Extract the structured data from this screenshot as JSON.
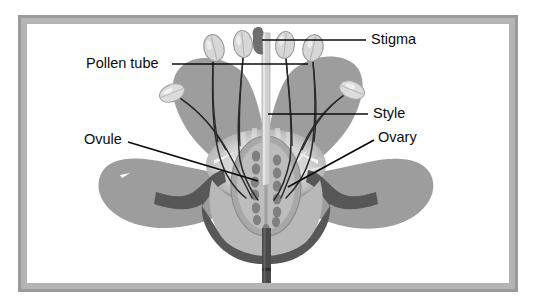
{
  "figure": {
    "title_text": "",
    "kind": "flower-cross-section-diagram",
    "background_color": "#ffffff",
    "frame": {
      "border_color": "#9a9a9a",
      "border_highlight_color": "#c9c9c9",
      "inner_fill": "#ffffff",
      "x": 18,
      "y": 15,
      "width": 500,
      "height": 277,
      "thickness": 9
    }
  },
  "labels": {
    "stigma": {
      "text": "Stigma",
      "x": 371,
      "y": 39
    },
    "pollen_tube": {
      "text": "Pollen tube",
      "x": 86,
      "y": 64
    },
    "style": {
      "text": "Style",
      "x": 373,
      "y": 113
    },
    "ovule": {
      "text": "Ovule",
      "x": 84,
      "y": 139
    },
    "ovary": {
      "text": "Ovary",
      "x": 378,
      "y": 137
    }
  },
  "colors": {
    "petal": "#9d9d9d",
    "petal_shadow": "#8a8a8a",
    "petal_highlight": "#d8d8d8",
    "sepal_dark": "#575757",
    "receptacle_mid": "#b8b8b8",
    "ovary_wall": "#a8a8a8",
    "ovary_inner": "#bdbdbd",
    "ovule_dot": "#808080",
    "anther_fill": "#d7d7d7",
    "anther_edge": "#9b9b9b",
    "style_shaft": "#cfcfcf",
    "stigma_knob": "#6e6e6e",
    "stem": "#4a4a4a",
    "line_black": "#0b0b0b"
  },
  "structures": {
    "anthers_upper": [
      {
        "name": "anther-upper-1",
        "cx": 214,
        "cy": 48,
        "rx": 10,
        "ry": 13,
        "rot": -14
      },
      {
        "name": "anther-upper-2",
        "cx": 243,
        "cy": 44,
        "rx": 9.5,
        "ry": 13,
        "rot": -6
      },
      {
        "name": "anther-upper-3",
        "cx": 284,
        "cy": 45,
        "rx": 9.5,
        "ry": 13,
        "rot": 6
      },
      {
        "name": "anther-upper-4",
        "cx": 312,
        "cy": 48,
        "rx": 10,
        "ry": 13,
        "rot": 13
      }
    ],
    "anthers_side": [
      {
        "name": "anther-side-left",
        "cx": 172,
        "cy": 93,
        "rx": 12,
        "ry": 8,
        "rot": -20
      },
      {
        "name": "anther-side-right",
        "cx": 352,
        "cy": 90,
        "rx": 12,
        "ry": 8,
        "rot": 20
      }
    ],
    "style": {
      "x": 266,
      "y_top": 34,
      "y_bottom": 185,
      "width": 7
    },
    "stigma": {
      "cx": 259,
      "cy": 38,
      "rx": 6,
      "ry": 9
    },
    "ovary": {
      "cx": 266,
      "cy": 186,
      "rx": 33,
      "ry": 48
    },
    "ovules": {
      "count": 14,
      "left_column_x": 256,
      "right_column_x": 277,
      "y_start": 158,
      "y_step": 13,
      "rx": 4.2,
      "ry": 5.6
    },
    "stem": {
      "x": 262,
      "y_top": 230,
      "width": 9,
      "y_bottom": 292
    }
  },
  "pollen_tubes": {
    "count": 6,
    "description": "thin dark curved lines running from each anther down into the ovary"
  }
}
